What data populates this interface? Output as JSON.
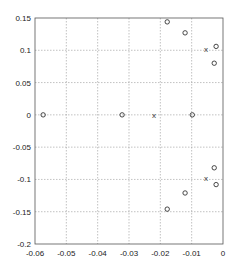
{
  "chart_data": {
    "type": "scatter",
    "title": "",
    "xlabel": "",
    "ylabel": "",
    "xlim": [
      -0.06,
      0
    ],
    "ylim": [
      -0.2,
      0.15
    ],
    "grid": true,
    "legend": null,
    "x_ticks": [
      "-0.06",
      "-0.05",
      "-0.04",
      "-0.03",
      "-0.02",
      "-0.01",
      "0"
    ],
    "x_tick_values": [
      -0.06,
      -0.05,
      -0.04,
      -0.03,
      -0.02,
      -0.01,
      0
    ],
    "y_ticks": [
      "0.15",
      "0.1",
      "0.05",
      "0",
      "-0.05",
      "-0.1",
      "-0.15",
      "-0.2"
    ],
    "y_tick_values": [
      0.15,
      0.1,
      0.05,
      0,
      -0.05,
      -0.1,
      -0.15,
      -0.2
    ],
    "series": [
      {
        "name": "zeros",
        "marker": "o",
        "points": [
          [
            -0.0574,
            0.0
          ],
          [
            -0.0322,
            0.0
          ],
          [
            -0.0098,
            0.0
          ],
          [
            -0.0178,
            0.144
          ],
          [
            -0.0121,
            0.127
          ],
          [
            -0.0022,
            0.106
          ],
          [
            -0.0028,
            0.08
          ],
          [
            -0.0028,
            -0.082
          ],
          [
            -0.0022,
            -0.108
          ],
          [
            -0.0121,
            -0.121
          ],
          [
            -0.0178,
            -0.146
          ]
        ]
      },
      {
        "name": "poles",
        "marker": "x",
        "points": [
          [
            -0.022,
            0.0
          ],
          [
            -0.0054,
            0.102
          ],
          [
            -0.0054,
            -0.098
          ]
        ]
      }
    ]
  },
  "colors": {
    "axis": "#555555",
    "grid": "#999999",
    "marker": "#333333",
    "background": "#ffffff"
  }
}
